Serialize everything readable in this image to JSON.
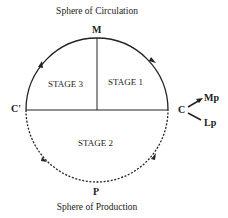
{
  "diagram": {
    "top_title": "Sphere of Circulation",
    "bottom_title": "Sphere of Production",
    "points": {
      "top": "M",
      "bottom": "P",
      "left": "C'",
      "right": "C",
      "branch_upper": "Mp",
      "branch_lower": "Lp"
    },
    "stages": {
      "upper_left": "STAGE 3",
      "upper_right": "STAGE 1",
      "lower": "STAGE 2"
    },
    "styles": {
      "upper_arc": "solid",
      "lower_arc": "dashed",
      "line_color": "#222222"
    }
  }
}
